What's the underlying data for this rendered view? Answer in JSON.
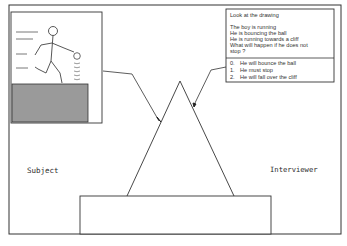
{
  "diagram": {
    "labels": {
      "subject": "Subject",
      "interviewer": "Interviewer"
    },
    "drawing_panel": {
      "description": "Stick figure boy running while bouncing a ball toward a cliff edge",
      "elements": [
        "speed-lines",
        "stick-figure",
        "ball",
        "bounce-marks",
        "cliff"
      ]
    },
    "prompt_card": {
      "instruction": "Look at the drawing",
      "lines": [
        "The boy is running",
        "He is bouncing the ball",
        "He is running towards a cliff",
        "What will happen if he does not",
        "stop ?"
      ],
      "answers": [
        {
          "code": "0.",
          "text": "He will bounce the ball"
        },
        {
          "code": "1.",
          "text": "He must stop"
        },
        {
          "code": "2.",
          "text": "He will fall over the cliff"
        }
      ]
    },
    "colors": {
      "line": "#333333",
      "cliff_fill": "#9a9a9a",
      "background": "#ffffff"
    }
  }
}
